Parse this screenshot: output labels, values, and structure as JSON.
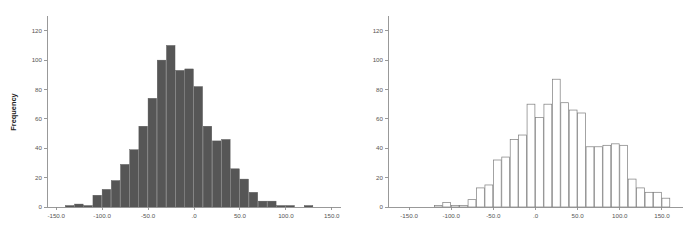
{
  "figure": {
    "background_color": "#ffffff",
    "panel_count": 2
  },
  "chart_data": [
    {
      "id": "left-histogram",
      "type": "bar",
      "title": "",
      "xlabel": "",
      "ylabel": "Frequency",
      "grid": false,
      "legend": "none",
      "bar_style": "filled",
      "bar_color": "#565656",
      "bar_edge_color": "#565656",
      "xlim": [
        -160,
        160
      ],
      "ylim": [
        0,
        128
      ],
      "xticks": [
        -150,
        -100,
        -50,
        0,
        50,
        100,
        150
      ],
      "xtick_labels": [
        "-150.0",
        "-100.0",
        "-50.0",
        ".0",
        "50.0",
        "100.0",
        "150.0"
      ],
      "yticks": [
        0,
        20,
        40,
        60,
        80,
        100,
        120
      ],
      "ytick_labels": [
        "0",
        "20",
        "40",
        "60",
        "80",
        "100",
        "120"
      ],
      "bin_width": 10,
      "bin_centers": [
        -135,
        -125,
        -115,
        -105,
        -95,
        -85,
        -75,
        -65,
        -55,
        -45,
        -35,
        -25,
        -15,
        -5,
        5,
        15,
        25,
        35,
        45,
        55,
        65,
        75,
        85,
        95,
        105,
        115,
        125
      ],
      "values": [
        1,
        2,
        1,
        8,
        12,
        18,
        29,
        39,
        55,
        74,
        100,
        110,
        93,
        94,
        82,
        55,
        45,
        46,
        26,
        19,
        10,
        4,
        4,
        1,
        1,
        0,
        1
      ]
    },
    {
      "id": "right-histogram",
      "type": "bar",
      "title": "",
      "xlabel": "",
      "ylabel": "",
      "grid": false,
      "legend": "none",
      "bar_style": "outlined",
      "bar_color": "#ffffff",
      "bar_edge_color": "#7d7d7d",
      "xlim": [
        -175,
        175
      ],
      "ylim": [
        0,
        128
      ],
      "xticks": [
        -150,
        -100,
        -50,
        0,
        50,
        100,
        150
      ],
      "xtick_labels": [
        "-150.0",
        "-100.0",
        "-50.0",
        ".0",
        "50.0",
        "100.0",
        "150.0"
      ],
      "yticks": [
        0,
        20,
        40,
        60,
        80,
        100,
        120
      ],
      "ytick_labels": [
        "0",
        "20",
        "40",
        "60",
        "80",
        "100",
        "120"
      ],
      "bin_width": 10,
      "bin_centers": [
        -115,
        -105,
        -95,
        -85,
        -75,
        -65,
        -55,
        -45,
        -35,
        -25,
        -15,
        -5,
        5,
        15,
        25,
        35,
        45,
        55,
        65,
        75,
        85,
        95,
        105,
        115,
        125,
        135,
        145,
        155
      ],
      "values": [
        1,
        3,
        1,
        1,
        5,
        13,
        15,
        32,
        34,
        46,
        49,
        70,
        61,
        70,
        87,
        71,
        66,
        64,
        41,
        41,
        42,
        43,
        42,
        19,
        13,
        10,
        10,
        6
      ]
    }
  ]
}
